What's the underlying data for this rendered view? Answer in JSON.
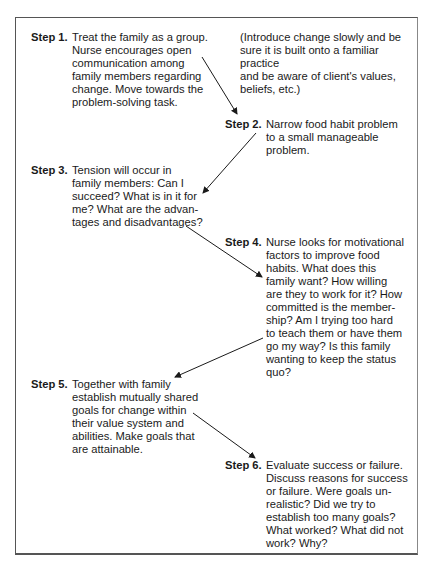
{
  "steps": [
    {
      "label": "Step 1.",
      "text": "Treat the family as a group.\nNurse encourages open\ncommunication among\nfamily members regarding\nchange. Move towards the\nproblem-solving task."
    },
    {
      "label": "Step 2.",
      "text": "Narrow food habit problem\nto a small manageable\nproblem."
    },
    {
      "label": "Step 3.",
      "text": "Tension will occur in\nfamily members: Can I\nsucceed? What is in it for\nme? What are the advan-\ntages and disadvantages?"
    },
    {
      "label": "Step 4.",
      "text": "Nurse looks for motivational\nfactors to improve food\nhabits. What does this\nfamily want? How willing\nare they to work for it? How\ncommitted is the member-\nship? Am I trying too hard\nto teach them or have them\ngo my way? Is this family\nwanting to keep the status\nquo?"
    },
    {
      "label": "Step 5.",
      "text": "Together with family\nestablish mutually shared\ngoals for change within\ntheir value system and\nabilities. Make goals that\nare attainable."
    },
    {
      "label": "Step 6.",
      "text": "Evaluate success or failure.\nDiscuss reasons for success\nor failure. Were goals un-\nrealistic? Did we try to\nestablish too many goals?\nWhat worked? What did not\nwork? Why?"
    }
  ],
  "note": "(Introduce change slowly and be\nsure it is built onto a familiar practice\nand be aware of client's values,\nbeliefs, etc.)",
  "arrows": [
    {
      "from": "Step 1",
      "to": "Step 2"
    },
    {
      "from": "Step 2",
      "to": "Step 3"
    },
    {
      "from": "Step 3",
      "to": "Step 4"
    },
    {
      "from": "Step 4",
      "to": "Step 5"
    },
    {
      "from": "Step 5",
      "to": "Step 6"
    }
  ]
}
